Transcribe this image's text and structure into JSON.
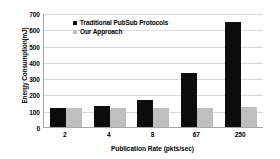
{
  "chart_data": {
    "type": "bar",
    "title": "",
    "xlabel": "Publication Rate (pkts/sec)",
    "ylabel": "Energy Consumption(mJ)",
    "categories": [
      "2",
      "4",
      "8",
      "67",
      "250"
    ],
    "series": [
      {
        "name": "Traditional PubSub Protocols",
        "color": "#0d0d0d",
        "values": [
          125,
          135,
          170,
          340,
          650
        ]
      },
      {
        "name": "Our Approach",
        "color": "#bfbfbf",
        "values": [
          125,
          125,
          125,
          125,
          128
        ]
      }
    ],
    "ylim": [
      0,
      700
    ],
    "ytick_labels": [
      "0",
      "100",
      "200",
      "300",
      "400",
      "500",
      "600",
      "700"
    ],
    "ytick_values": [
      0,
      100,
      200,
      300,
      400,
      500,
      600,
      700
    ],
    "grid": true,
    "legend_position": "top-center"
  }
}
